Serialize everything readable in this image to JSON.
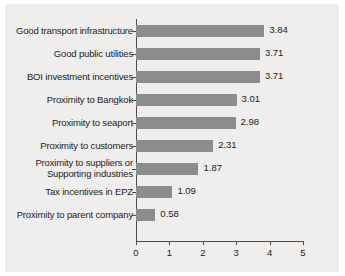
{
  "chart_data": {
    "type": "bar",
    "orientation": "horizontal",
    "title": "",
    "xlabel": "",
    "ylabel": "",
    "xlim": [
      0,
      5
    ],
    "xticks": [
      "0",
      "1",
      "2",
      "3",
      "4",
      "5"
    ],
    "grid": false,
    "legend": false,
    "bar_color": "#8c8c8c",
    "background_color": "#efeeec",
    "axis_color": "#4a4a4a",
    "text_color": "#1d1d1d",
    "categories": [
      "Good transport infrastructure",
      "Good public utilities",
      "BOI investment incentives",
      "Proximity to Bangkok",
      "Proximity to seaport",
      "Proximity to customers",
      "Proximity to suppliers or\nSupporting industries",
      "Tax incentives in EPZ",
      "Proximity to parent company"
    ],
    "values": [
      3.84,
      3.71,
      3.71,
      3.01,
      2.98,
      2.31,
      1.87,
      1.09,
      0.58
    ],
    "value_labels": [
      "3.84",
      "3.71",
      "3.71",
      "3.01",
      "2.98",
      "2.31",
      "1.87",
      "1.09",
      "0.58"
    ]
  }
}
